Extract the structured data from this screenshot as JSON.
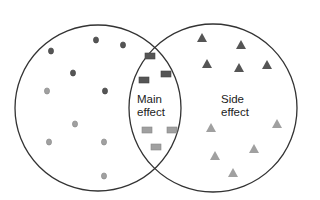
{
  "diagram": {
    "type": "venn",
    "sets": [
      {
        "name": "left-set",
        "label": ""
      },
      {
        "name": "right-set",
        "label": ""
      }
    ],
    "intersection_label": {
      "line1": "Main",
      "line2": "effect"
    },
    "right_label": {
      "line1": "Side",
      "line2": "effect"
    },
    "colors": {
      "outline": "#333333",
      "dark": "#555555",
      "light": "#a0a0a0",
      "light_stroke": "#888888"
    },
    "markers": {
      "left_circles": [
        {
          "x": 51,
          "y": 51,
          "shade": "dark"
        },
        {
          "x": 96,
          "y": 40,
          "shade": "dark"
        },
        {
          "x": 123,
          "y": 45,
          "shade": "dark"
        },
        {
          "x": 73,
          "y": 73,
          "shade": "dark"
        },
        {
          "x": 47,
          "y": 91,
          "shade": "light"
        },
        {
          "x": 105,
          "y": 91,
          "shade": "dark"
        },
        {
          "x": 75,
          "y": 124,
          "shade": "light"
        },
        {
          "x": 49,
          "y": 142,
          "shade": "light"
        },
        {
          "x": 104,
          "y": 142,
          "shade": "light"
        },
        {
          "x": 104,
          "y": 176,
          "shade": "light"
        }
      ],
      "intersection_rects": [
        {
          "x": 150,
          "y": 56,
          "shade": "dark"
        },
        {
          "x": 144,
          "y": 80,
          "shade": "dark"
        },
        {
          "x": 166,
          "y": 74,
          "shade": "dark"
        },
        {
          "x": 147,
          "y": 130,
          "shade": "light"
        },
        {
          "x": 172,
          "y": 130,
          "shade": "light"
        },
        {
          "x": 156,
          "y": 147,
          "shade": "light"
        }
      ],
      "right_triangles": [
        {
          "x": 202,
          "y": 38,
          "shade": "dark"
        },
        {
          "x": 241,
          "y": 45,
          "shade": "dark"
        },
        {
          "x": 207,
          "y": 64,
          "shade": "dark"
        },
        {
          "x": 239,
          "y": 68,
          "shade": "dark"
        },
        {
          "x": 267,
          "y": 65,
          "shade": "dark"
        },
        {
          "x": 211,
          "y": 128,
          "shade": "light"
        },
        {
          "x": 277,
          "y": 124,
          "shade": "light"
        },
        {
          "x": 254,
          "y": 149,
          "shade": "light"
        },
        {
          "x": 215,
          "y": 156,
          "shade": "light"
        },
        {
          "x": 233,
          "y": 173,
          "shade": "light"
        }
      ]
    }
  }
}
